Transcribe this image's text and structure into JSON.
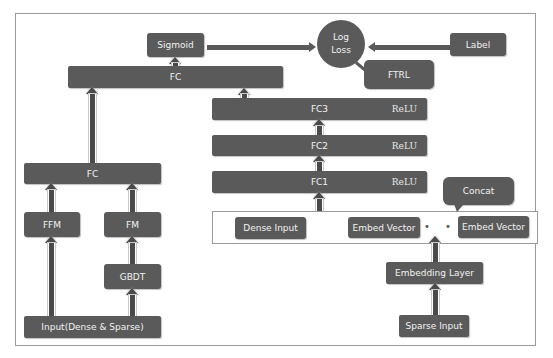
{
  "diagram": {
    "title": "",
    "colors": {
      "block": "#5a5a5a",
      "text": "#f2f2f2",
      "border": "#9a9a9a",
      "background": "#ffffff"
    },
    "top": {
      "sigmoid": "Sigmoid",
      "log_loss_line1": "Log",
      "log_loss_line2": "Loss",
      "label": "Label",
      "ftrl": "FTRL",
      "fc_top": "FC"
    },
    "dnn": {
      "fc3": {
        "label": "FC3",
        "activation": "ReLU"
      },
      "fc2": {
        "label": "FC2",
        "activation": "ReLU"
      },
      "fc1": {
        "label": "FC1",
        "activation": "ReLU"
      },
      "concat": "Concat",
      "dense_input": "Dense Input",
      "embed_vector_1": "Embed Vector",
      "ellipsis": "• • •",
      "embed_vector_2": "Embed Vector",
      "embedding_layer": "Embedding Layer",
      "sparse_input": "Sparse Input"
    },
    "wide": {
      "fc": "FC",
      "ffm": "FFM",
      "fm": "FM",
      "gbdt": "GBDT",
      "input": "Input(Dense & Sparse)"
    },
    "edges": [
      [
        "Input(Dense & Sparse)",
        "FFM"
      ],
      [
        "Input(Dense & Sparse)",
        "GBDT"
      ],
      [
        "GBDT",
        "FM"
      ],
      [
        "FFM",
        "FC"
      ],
      [
        "FM",
        "FC"
      ],
      [
        "FC",
        "FC (top)"
      ],
      [
        "Sparse Input",
        "Embedding Layer"
      ],
      [
        "Embedding Layer",
        "Embed Vector"
      ],
      [
        "Concat",
        "FC1"
      ],
      [
        "FC1",
        "FC2"
      ],
      [
        "FC2",
        "FC3"
      ],
      [
        "FC3",
        "FC (top)"
      ],
      [
        "FC (top)",
        "Sigmoid"
      ],
      [
        "Sigmoid",
        "Log Loss"
      ],
      [
        "Label",
        "Log Loss"
      ],
      [
        "Log Loss",
        "FTRL"
      ]
    ]
  }
}
